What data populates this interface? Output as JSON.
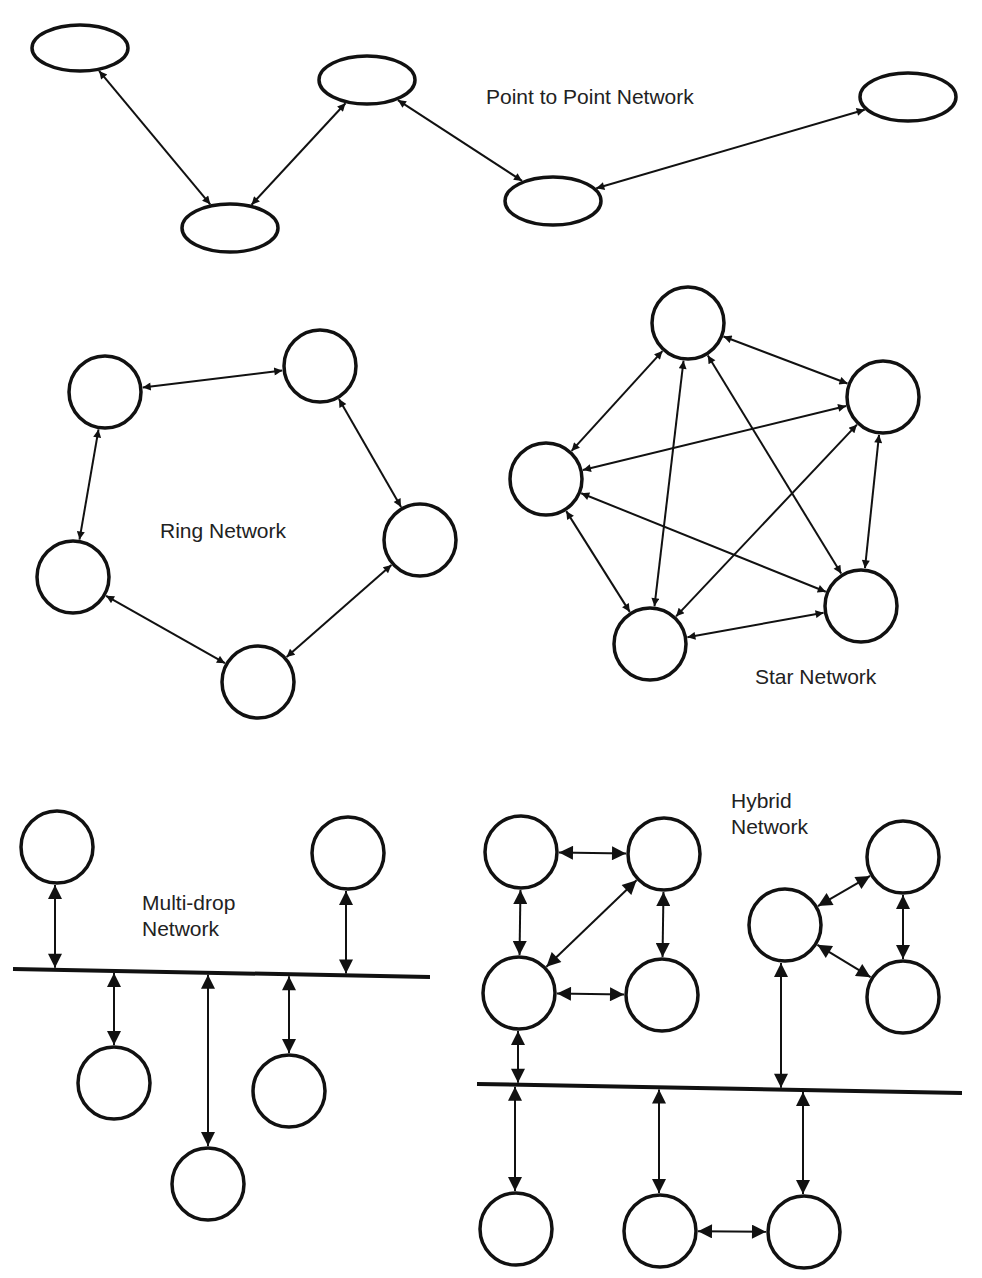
{
  "diagram": {
    "style": {
      "stroke_color": "#111111",
      "text_color": "#222222",
      "background": "#ffffff"
    },
    "sections": [
      {
        "id": "point-to-point",
        "label_lines": [
          "Point to Point Network"
        ],
        "label_pos": [
          486,
          104
        ],
        "node_shape": "ellipse",
        "nodes": [
          {
            "id": "p1",
            "cx": 80,
            "cy": 48,
            "rx": 48,
            "ry": 23
          },
          {
            "id": "p2",
            "cx": 230,
            "cy": 228,
            "rx": 48,
            "ry": 24
          },
          {
            "id": "p3",
            "cx": 367,
            "cy": 80,
            "rx": 48,
            "ry": 24
          },
          {
            "id": "p4",
            "cx": 553,
            "cy": 201,
            "rx": 48,
            "ry": 24
          },
          {
            "id": "p5",
            "cx": 908,
            "cy": 97,
            "rx": 48,
            "ry": 24
          }
        ],
        "links": [
          [
            "p1",
            "p2"
          ],
          [
            "p2",
            "p3"
          ],
          [
            "p3",
            "p4"
          ],
          [
            "p4",
            "p5"
          ]
        ]
      },
      {
        "id": "ring",
        "label_lines": [
          "Ring Network"
        ],
        "label_pos": [
          160,
          538
        ],
        "node_shape": "circle",
        "nodes": [
          {
            "id": "r1",
            "cx": 105,
            "cy": 392,
            "r": 36
          },
          {
            "id": "r2",
            "cx": 320,
            "cy": 366,
            "r": 36
          },
          {
            "id": "r3",
            "cx": 420,
            "cy": 540,
            "r": 36
          },
          {
            "id": "r4",
            "cx": 73,
            "cy": 577,
            "r": 36
          },
          {
            "id": "r5",
            "cx": 258,
            "cy": 682,
            "r": 36
          }
        ],
        "links": [
          [
            "r1",
            "r2"
          ],
          [
            "r2",
            "r3"
          ],
          [
            "r3",
            "r5"
          ],
          [
            "r5",
            "r4"
          ],
          [
            "r4",
            "r1"
          ]
        ]
      },
      {
        "id": "star",
        "label_lines": [
          "Star Network"
        ],
        "label_pos": [
          755,
          684
        ],
        "node_shape": "circle",
        "nodes": [
          {
            "id": "s1",
            "cx": 688,
            "cy": 323,
            "r": 36
          },
          {
            "id": "s2",
            "cx": 883,
            "cy": 397,
            "r": 36
          },
          {
            "id": "s3",
            "cx": 546,
            "cy": 479,
            "r": 36
          },
          {
            "id": "s4",
            "cx": 650,
            "cy": 644,
            "r": 36
          },
          {
            "id": "s5",
            "cx": 861,
            "cy": 606,
            "r": 36
          }
        ],
        "links": [
          [
            "s1",
            "s2"
          ],
          [
            "s1",
            "s3"
          ],
          [
            "s1",
            "s4"
          ],
          [
            "s1",
            "s5"
          ],
          [
            "s2",
            "s3"
          ],
          [
            "s2",
            "s4"
          ],
          [
            "s2",
            "s5"
          ],
          [
            "s3",
            "s4"
          ],
          [
            "s3",
            "s5"
          ],
          [
            "s4",
            "s5"
          ]
        ]
      },
      {
        "id": "multi-drop",
        "label_lines": [
          "Multi-drop",
          "Network"
        ],
        "label_pos": [
          142,
          910
        ],
        "node_shape": "circle",
        "bus": {
          "x1": 13,
          "y1": 969,
          "x2": 430,
          "y2": 977
        },
        "nodes": [
          {
            "id": "m1",
            "cx": 57,
            "cy": 847,
            "r": 36
          },
          {
            "id": "m2",
            "cx": 348,
            "cy": 853,
            "r": 36
          },
          {
            "id": "m3",
            "cx": 114,
            "cy": 1083,
            "r": 36
          },
          {
            "id": "m4",
            "cx": 289,
            "cy": 1091,
            "r": 36
          },
          {
            "id": "m5",
            "cx": 208,
            "cy": 1184,
            "r": 36
          }
        ],
        "drops": [
          {
            "node": "m1",
            "x": 55,
            "side": "above"
          },
          {
            "node": "m2",
            "x": 346,
            "side": "above"
          },
          {
            "node": "m3",
            "x": 114,
            "side": "below"
          },
          {
            "node": "m4",
            "x": 289,
            "side": "below"
          },
          {
            "node": "m5",
            "x": 208,
            "side": "below"
          }
        ]
      },
      {
        "id": "hybrid",
        "label_lines": [
          "Hybrid",
          "Network"
        ],
        "label_pos": [
          731,
          808
        ],
        "node_shape": "circle",
        "bus": {
          "x1": 477,
          "y1": 1084,
          "x2": 962,
          "y2": 1093
        },
        "nodes": [
          {
            "id": "h1",
            "cx": 521,
            "cy": 852,
            "r": 36
          },
          {
            "id": "h2",
            "cx": 664,
            "cy": 854,
            "r": 36
          },
          {
            "id": "h3",
            "cx": 519,
            "cy": 993,
            "r": 36
          },
          {
            "id": "h4",
            "cx": 662,
            "cy": 995,
            "r": 36
          },
          {
            "id": "h5",
            "cx": 785,
            "cy": 925,
            "r": 36
          },
          {
            "id": "h6",
            "cx": 903,
            "cy": 857,
            "r": 36
          },
          {
            "id": "h7",
            "cx": 903,
            "cy": 997,
            "r": 36
          },
          {
            "id": "h8",
            "cx": 516,
            "cy": 1229,
            "r": 36
          },
          {
            "id": "h9",
            "cx": 660,
            "cy": 1231,
            "r": 36
          },
          {
            "id": "h10",
            "cx": 804,
            "cy": 1232,
            "r": 36
          }
        ],
        "links": [
          [
            "h1",
            "h2"
          ],
          [
            "h1",
            "h3"
          ],
          [
            "h2",
            "h4"
          ],
          [
            "h2",
            "h3"
          ],
          [
            "h3",
            "h4"
          ],
          [
            "h5",
            "h6"
          ],
          [
            "h6",
            "h7"
          ],
          [
            "h5",
            "h7"
          ],
          [
            "h9",
            "h10"
          ]
        ],
        "drops": [
          {
            "node": "h3",
            "x": 518,
            "side": "above"
          },
          {
            "node": "h5",
            "x": 781,
            "side": "above"
          },
          {
            "node": "h8",
            "x": 515,
            "side": "below"
          },
          {
            "node": "h9",
            "x": 659,
            "side": "below"
          },
          {
            "node": "h10",
            "x": 803,
            "side": "below"
          }
        ]
      }
    ]
  }
}
